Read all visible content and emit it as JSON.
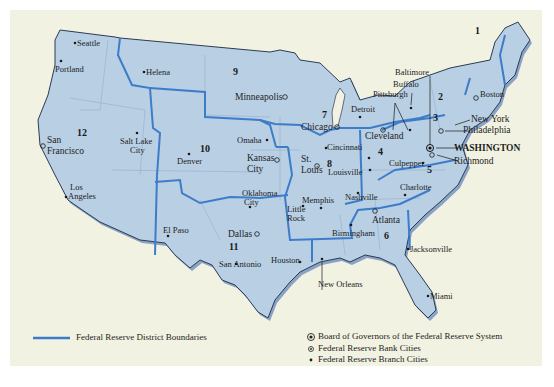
{
  "map": {
    "colors": {
      "land": "#b9cfe4",
      "boundary": "#3d7cc9",
      "paper": "#f2f2e2",
      "coast": "#2b3b55"
    },
    "districts": [
      {
        "number": "1",
        "x": 521,
        "y": 33
      },
      {
        "number": "2",
        "x": 436,
        "y": 95
      },
      {
        "number": "3",
        "x": 436,
        "y": 117
      },
      {
        "number": "4",
        "x": 377,
        "y": 150
      },
      {
        "number": "5",
        "x": 428,
        "y": 167
      },
      {
        "number": "6",
        "x": 385,
        "y": 234
      },
      {
        "number": "7",
        "x": 324,
        "y": 113
      },
      {
        "number": "8",
        "x": 327,
        "y": 162
      },
      {
        "number": "9",
        "x": 233,
        "y": 71
      },
      {
        "number": "10",
        "x": 203,
        "y": 148
      },
      {
        "number": "11",
        "x": 232,
        "y": 246
      },
      {
        "number": "12",
        "x": 80,
        "y": 131
      }
    ],
    "cities": [
      {
        "name": "Seattle",
        "type": "branch"
      },
      {
        "name": "Portland",
        "type": "branch"
      },
      {
        "name": "Helena",
        "type": "branch"
      },
      {
        "name": "San Francisco",
        "type": "bank"
      },
      {
        "name": "Salt Lake City",
        "type": "branch"
      },
      {
        "name": "Los Angeles",
        "type": "branch"
      },
      {
        "name": "Denver",
        "type": "branch"
      },
      {
        "name": "Minneapolis",
        "type": "bank"
      },
      {
        "name": "Omaha",
        "type": "branch"
      },
      {
        "name": "Kansas City",
        "type": "bank"
      },
      {
        "name": "Oklahoma City",
        "type": "branch"
      },
      {
        "name": "El Paso",
        "type": "branch"
      },
      {
        "name": "Dallas",
        "type": "bank"
      },
      {
        "name": "San Antonio",
        "type": "branch"
      },
      {
        "name": "Houston",
        "type": "branch"
      },
      {
        "name": "Chicago",
        "type": "bank"
      },
      {
        "name": "Detroit",
        "type": "branch"
      },
      {
        "name": "St. Louis",
        "type": "bank"
      },
      {
        "name": "Louisville",
        "type": "branch"
      },
      {
        "name": "Memphis",
        "type": "branch"
      },
      {
        "name": "Little Rock",
        "type": "branch"
      },
      {
        "name": "Nashville",
        "type": "branch"
      },
      {
        "name": "Cincinnati",
        "type": "branch"
      },
      {
        "name": "Cleveland",
        "type": "bank"
      },
      {
        "name": "Pittsburgh",
        "type": "branch"
      },
      {
        "name": "Buffalo",
        "type": "branch"
      },
      {
        "name": "Baltimore",
        "type": "branch"
      },
      {
        "name": "Boston",
        "type": "bank"
      },
      {
        "name": "New York",
        "type": "bank"
      },
      {
        "name": "Philadelphia",
        "type": "bank"
      },
      {
        "name": "WASHINGTON",
        "type": "board"
      },
      {
        "name": "Richmond",
        "type": "bank"
      },
      {
        "name": "Culpepper",
        "type": "branch"
      },
      {
        "name": "Charlotte",
        "type": "branch"
      },
      {
        "name": "Atlanta",
        "type": "bank"
      },
      {
        "name": "Birmingham",
        "type": "branch"
      },
      {
        "name": "Jacksonville",
        "type": "branch"
      },
      {
        "name": "Miami",
        "type": "branch"
      },
      {
        "name": "New Orleans",
        "type": "branch"
      }
    ],
    "labels": {
      "seattle": "Seattle",
      "portland": "Portland",
      "helena": "Helena",
      "san": "San",
      "francisco": "Francisco",
      "salt_lake": "Salt Lake",
      "city": "City",
      "los": "Los",
      "angeles": "Angeles",
      "denver": "Denver",
      "minneapolis": "Minneapolis",
      "omaha": "Omaha",
      "kansas": "Kansas",
      "oklahoma": "Oklahoma",
      "el_paso": "El Paso",
      "dallas": "Dallas",
      "san_antonio": "San Antonio",
      "houston": "Houston",
      "chicago": "Chicago",
      "detroit": "Detroit",
      "st": "St.",
      "louis": "Louis",
      "louisville": "Louisville",
      "memphis": "Memphis",
      "little": "Little",
      "rock": "Rock",
      "nashville": "Nashville",
      "cincinnati": "Cincinnati",
      "cleveland": "Cleveland",
      "pittsburgh": "Pittsburgh",
      "buffalo": "Buffalo",
      "baltimore": "Baltimore",
      "boston": "Boston",
      "new_york": "New York",
      "philadelphia": "Philadelphia",
      "washington": "WASHINGTON",
      "richmond": "Richmond",
      "culpepper": "Culpepper",
      "charlotte": "Charlotte",
      "atlanta": "Atlanta",
      "birmingham": "Birmingham",
      "jacksonville": "Jacksonville",
      "miami": "Miami",
      "new_orleans": "New Orleans"
    }
  },
  "legend": {
    "boundaries": "Federal Reserve District Boundaries",
    "board": "Board of Governors of the Federal Reserve System",
    "bank": "Federal Reserve Bank Cities",
    "branch": "Federal Reserve Branch Cities"
  }
}
